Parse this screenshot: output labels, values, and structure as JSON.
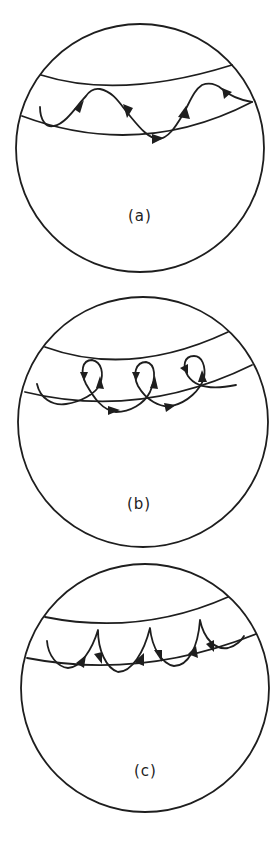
{
  "figure": {
    "panels": [
      {
        "id": "a",
        "label": "(a)",
        "description": "Wavy trajectory bouncing between two band boundaries on a sphere"
      },
      {
        "id": "b",
        "label": "(b)",
        "description": "Looping trajectory with small loops drifting along the band"
      },
      {
        "id": "c",
        "label": "(c)",
        "description": "Cusped trajectory touching the upper boundary with cusps"
      }
    ],
    "colors": {
      "line": "#1e1e1e",
      "background": "#ffffff"
    }
  }
}
